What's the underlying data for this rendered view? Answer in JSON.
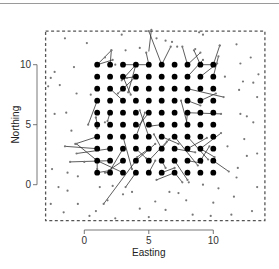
{
  "chart_data": {
    "type": "scatter",
    "title": "",
    "xlabel": "Easting",
    "ylabel": "Northing",
    "xlim": [
      -3,
      14
    ],
    "ylim": [
      -3,
      12.8
    ],
    "xticks": [
      0,
      5,
      10
    ],
    "yticks": [
      0,
      5,
      10
    ],
    "xtick_labels": [
      "0",
      "5",
      "10"
    ],
    "ytick_labels": [
      "0",
      "5",
      "10"
    ],
    "grid": false,
    "legend": null,
    "study_region": {
      "x0": -3,
      "x1": 14,
      "y0": -3,
      "y1": 12.8,
      "style": "dashed"
    },
    "series": [
      {
        "name": "grid points",
        "marker": "large-filled-circle",
        "color": "#000000",
        "grid_x": [
          1,
          2,
          3,
          4,
          5,
          6,
          7,
          8,
          9,
          10
        ],
        "grid_y": [
          1,
          2,
          3,
          4,
          5,
          6,
          7,
          8,
          9,
          10
        ]
      },
      {
        "name": "random points",
        "marker": "small-point",
        "color": "#777777",
        "points": [
          [
            -1.5,
            12.2
          ],
          [
            0.2,
            11.8
          ],
          [
            2.9,
            12.5
          ],
          [
            3.2,
            11.2
          ],
          [
            4.3,
            11.4
          ],
          [
            2.4,
            10.0
          ],
          [
            1.6,
            10.6
          ],
          [
            -0.8,
            9.8
          ],
          [
            -2.3,
            9.4
          ],
          [
            -2.6,
            8.9
          ],
          [
            -1.9,
            8.3
          ],
          [
            -0.6,
            7.6
          ],
          [
            0.5,
            7.5
          ],
          [
            -2.3,
            5.9
          ],
          [
            -1.4,
            6.0
          ],
          [
            0.9,
            5.6
          ],
          [
            1.6,
            5.2
          ],
          [
            -1.0,
            4.5
          ],
          [
            1.0,
            4.7
          ],
          [
            -2.8,
            8.2
          ],
          [
            5.6,
            12.2
          ],
          [
            6.3,
            12.0
          ],
          [
            6.8,
            11.9
          ],
          [
            7.2,
            11.5
          ],
          [
            8.6,
            11.3
          ],
          [
            8.9,
            12.7
          ],
          [
            9.2,
            12.5
          ],
          [
            10.5,
            11.6
          ],
          [
            11.8,
            11.7
          ],
          [
            12.1,
            10.1
          ],
          [
            12.9,
            10.6
          ],
          [
            13.5,
            9.2
          ],
          [
            10.9,
            9.0
          ],
          [
            12.3,
            8.6
          ],
          [
            13.1,
            8.5
          ],
          [
            12.0,
            7.9
          ],
          [
            13.4,
            7.3
          ],
          [
            12.1,
            5.9
          ],
          [
            12.6,
            5.7
          ],
          [
            13.1,
            5.2
          ],
          [
            12.4,
            3.8
          ],
          [
            11.1,
            3.2
          ],
          [
            12.6,
            2.4
          ],
          [
            13.4,
            2.6
          ],
          [
            11.9,
            1.4
          ],
          [
            13.4,
            -0.2
          ],
          [
            11.6,
            -1.0
          ],
          [
            10.4,
            -0.3
          ],
          [
            9.2,
            0.0
          ],
          [
            8.1,
            0.2
          ],
          [
            7.3,
            -0.7
          ],
          [
            6.6,
            -0.6
          ],
          [
            5.5,
            -1.4
          ],
          [
            4.3,
            -2.0
          ],
          [
            3.0,
            -0.8
          ],
          [
            1.8,
            -1.3
          ],
          [
            0.9,
            -2.2
          ],
          [
            -0.5,
            -1.6
          ],
          [
            -1.3,
            -0.5
          ],
          [
            -2.0,
            -0.2
          ],
          [
            -2.6,
            -1.6
          ],
          [
            -1.6,
            -2.3
          ],
          [
            0.4,
            -2.6
          ],
          [
            -0.5,
            0.7
          ],
          [
            -1.3,
            1.0
          ],
          [
            -2.5,
            1.3
          ],
          [
            0.0,
            1.9
          ],
          [
            2.2,
            -0.1
          ],
          [
            3.7,
            -0.6
          ],
          [
            1.2,
            -0.2
          ],
          [
            9.8,
            -2.6
          ],
          [
            8.4,
            -2.5
          ],
          [
            11.4,
            -2.5
          ],
          [
            13.0,
            -2.2
          ],
          [
            6.3,
            -2.1
          ],
          [
            2.4,
            -2.8
          ],
          [
            5.0,
            -2.7
          ],
          [
            10.0,
            -1.5
          ],
          [
            7.9,
            -1.3
          ],
          [
            11.8,
            0.6
          ]
        ]
      },
      {
        "name": "links",
        "style": "thin-line",
        "color": "#333333",
        "segments": [
          [
            [
              1,
              10
            ],
            [
              2.1,
              11.2
            ]
          ],
          [
            [
              2,
              10
            ],
            [
              2.1,
              11.2
            ]
          ],
          [
            [
              1,
              10
            ],
            [
              2.2,
              10.4
            ]
          ],
          [
            [
              3,
              10
            ],
            [
              4,
              10
            ]
          ],
          [
            [
              4,
              10
            ],
            [
              5,
              10
            ]
          ],
          [
            [
              4,
              10
            ],
            [
              2.9,
              8.7
            ]
          ],
          [
            [
              4,
              10
            ],
            [
              3.4,
              7.7
            ]
          ],
          [
            [
              4,
              9
            ],
            [
              3.3,
              8.9
            ]
          ],
          [
            [
              5,
              10
            ],
            [
              4.8,
              11.0
            ]
          ],
          [
            [
              6,
              10
            ],
            [
              5.0,
              12.8
            ]
          ],
          [
            [
              4,
              9
            ],
            [
              2.6,
              7.6
            ]
          ],
          [
            [
              3,
              9
            ],
            [
              3.6,
              7.5
            ]
          ],
          [
            [
              2,
              8
            ],
            [
              2.9,
              7.1
            ]
          ],
          [
            [
              5,
              11.1
            ],
            [
              5.2,
              12.9
            ]
          ],
          [
            [
              6,
              10
            ],
            [
              6.7,
              11.5
            ]
          ],
          [
            [
              8,
              10
            ],
            [
              7.6,
              11.5
            ]
          ],
          [
            [
              8,
              10
            ],
            [
              9.0,
              11.0
            ]
          ],
          [
            [
              9,
              10
            ],
            [
              8.5,
              11.2
            ]
          ],
          [
            [
              8,
              9
            ],
            [
              9.2,
              10.4
            ]
          ],
          [
            [
              9,
              9
            ],
            [
              10.3,
              10.1
            ]
          ],
          [
            [
              9,
              10
            ],
            [
              10,
              10
            ]
          ],
          [
            [
              10,
              10
            ],
            [
              10.5,
              11.6
            ]
          ],
          [
            [
              8,
              8
            ],
            [
              10.8,
              7.3
            ]
          ],
          [
            [
              8,
              7
            ],
            [
              9.0,
              6.6
            ]
          ],
          [
            [
              8,
              6
            ],
            [
              10.6,
              5.9
            ]
          ],
          [
            [
              8,
              5
            ],
            [
              7.5,
              7.0
            ]
          ],
          [
            [
              9,
              7
            ],
            [
              10.2,
              7.6
            ]
          ],
          [
            [
              10,
              9
            ],
            [
              10.4,
              10.7
            ]
          ],
          [
            [
              1,
              7
            ],
            [
              0.3,
              5.0
            ]
          ],
          [
            [
              5,
              6
            ],
            [
              4.2,
              4.9
            ]
          ],
          [
            [
              6,
              5
            ],
            [
              5.2,
              4.9
            ]
          ],
          [
            [
              1,
              5
            ],
            [
              0.9,
              5.6
            ]
          ],
          [
            [
              2,
              6
            ],
            [
              1.8,
              5.3
            ]
          ],
          [
            [
              8,
              6
            ],
            [
              7.9,
              5.0
            ]
          ],
          [
            [
              4,
              4
            ],
            [
              4.7,
              6.0
            ]
          ],
          [
            [
              5,
              4
            ],
            [
              4.3,
              6.2
            ]
          ],
          [
            [
              7,
              4
            ],
            [
              8.8,
              1.6
            ]
          ],
          [
            [
              6,
              3
            ],
            [
              6.6,
              3.8
            ]
          ],
          [
            [
              6,
              3
            ],
            [
              5.4,
              4.2
            ]
          ],
          [
            [
              5,
              3
            ],
            [
              4.1,
              2.3
            ]
          ],
          [
            [
              4,
              3
            ],
            [
              4.8,
              2.2
            ]
          ],
          [
            [
              4,
              2
            ],
            [
              5.5,
              3.4
            ]
          ],
          [
            [
              3,
              4
            ],
            [
              3.7,
              1.3
            ]
          ],
          [
            [
              3,
              2
            ],
            [
              1.9,
              1.2
            ]
          ],
          [
            [
              2,
              1
            ],
            [
              1.6,
              1.0
            ]
          ],
          [
            [
              1,
              4
            ],
            [
              -0.7,
              3.4
            ]
          ],
          [
            [
              1,
              3
            ],
            [
              -1.5,
              3.2
            ]
          ],
          [
            [
              2,
              3
            ],
            [
              -0.6,
              2.6
            ]
          ],
          [
            [
              2,
              2
            ],
            [
              -1.1,
              1.9
            ]
          ],
          [
            [
              1,
              2
            ],
            [
              -0.6,
              3.4
            ]
          ],
          [
            [
              1,
              2
            ],
            [
              1.0,
              1.3
            ]
          ],
          [
            [
              1,
              2
            ],
            [
              3.0,
              1.0
            ]
          ],
          [
            [
              1,
              1
            ],
            [
              2.1,
              1.2
            ]
          ],
          [
            [
              3,
              3
            ],
            [
              1.9,
              1.0
            ]
          ],
          [
            [
              4,
              2
            ],
            [
              1.5,
              -1.6
            ]
          ],
          [
            [
              4,
              1
            ],
            [
              3.2,
              -0.2
            ]
          ],
          [
            [
              5,
              1
            ],
            [
              5.5,
              2.0
            ]
          ],
          [
            [
              6,
              1
            ],
            [
              7.0,
              1.4
            ]
          ],
          [
            [
              6,
              2
            ],
            [
              6.3,
              1.4
            ]
          ],
          [
            [
              7,
              2
            ],
            [
              8.0,
              0.4
            ]
          ],
          [
            [
              7,
              3
            ],
            [
              8.6,
              2.7
            ]
          ],
          [
            [
              6,
              4
            ],
            [
              7.3,
              3.4
            ]
          ],
          [
            [
              8,
              3
            ],
            [
              9.5,
              3.9
            ]
          ],
          [
            [
              9,
              3
            ],
            [
              10.1,
              2.3
            ]
          ],
          [
            [
              9,
              3
            ],
            [
              10.6,
              4.3
            ]
          ],
          [
            [
              10,
              2
            ],
            [
              11.2,
              1.1
            ]
          ],
          [
            [
              7,
              1
            ],
            [
              7.6,
              0.2
            ]
          ],
          [
            [
              5,
              2
            ],
            [
              6.4,
              3.6
            ]
          ],
          [
            [
              7,
              1
            ],
            [
              5.6,
              0.4
            ]
          ],
          [
            [
              9,
              2
            ],
            [
              9.7,
              3.2
            ]
          ],
          [
            [
              8,
              2
            ],
            [
              9.1,
              1.8
            ]
          ],
          [
            [
              8,
              4
            ],
            [
              9.6,
              2.1
            ]
          ]
        ]
      }
    ]
  },
  "axes": {
    "x": {
      "title": "Easting",
      "ticks": [
        {
          "value": 0,
          "label": "0"
        },
        {
          "value": 5,
          "label": "5"
        },
        {
          "value": 10,
          "label": "10"
        }
      ]
    },
    "y": {
      "title": "Northing",
      "ticks": [
        {
          "value": 0,
          "label": "0"
        },
        {
          "value": 5,
          "label": "5"
        },
        {
          "value": 10,
          "label": "10"
        }
      ]
    }
  },
  "colors": {
    "grid_points": "#000000",
    "random_points": "#777777",
    "links": "#333333",
    "frame": "#555555",
    "axis": "#555555"
  }
}
